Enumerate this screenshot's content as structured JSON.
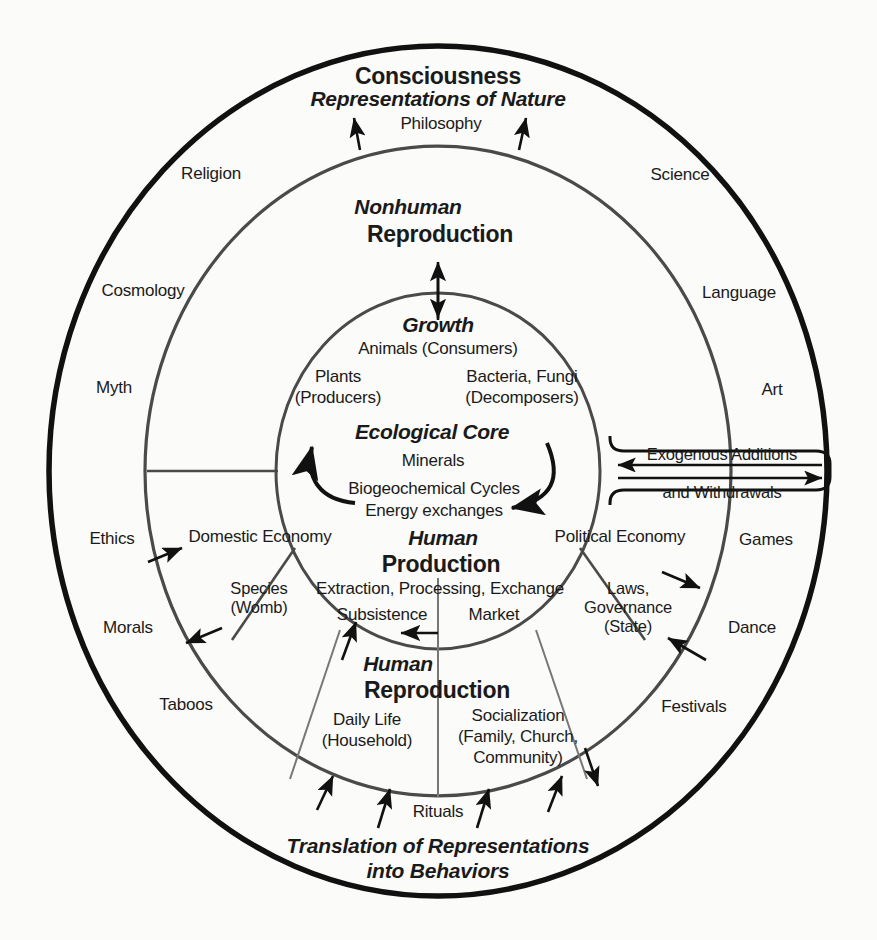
{
  "diagram": {
    "rings": {
      "outer": {
        "heading_bold": "Consciousness",
        "heading_italic": "Representations of Nature",
        "top_label": "Philosophy",
        "caption_line1": "Translation of Representations",
        "caption_line2": "into Behaviors",
        "labels": [
          "Religion",
          "Science",
          "Cosmology",
          "Language",
          "Myth",
          "Art",
          "Ethics",
          "Games",
          "Morals",
          "Dance",
          "Taboos",
          "Festivals"
        ]
      },
      "middle_top": {
        "heading_italic": "Nonhuman",
        "heading_bold": "Reproduction"
      },
      "middle_bottom": {
        "heading_italic": "Human",
        "heading_bold": "Reproduction",
        "left_label_line1": "Daily Life",
        "left_label_line2": "(Household)",
        "right_label_line1": "Socialization",
        "right_label_line2": "(Family, Church,",
        "right_label_line3": "Community)",
        "bottom_label": "Rituals"
      },
      "inner_band": {
        "left_sector": "Domestic Economy",
        "right_sector": "Political Economy",
        "left_sub_line1": "Species",
        "left_sub_line2": "(Womb)",
        "right_sub_line1": "Laws,",
        "right_sub_line2": "Governance",
        "right_sub_line3": "(State)",
        "heading_italic": "Human",
        "heading_bold": "Production",
        "detail": "Extraction, Processing, Exchange",
        "left_mode": "Subsistence",
        "right_mode": "Market"
      },
      "core": {
        "growth_italic": "Growth",
        "animals": "Animals (Consumers)",
        "plants_line1": "Plants",
        "plants_line2": "(Producers)",
        "bacteria_line1": "Bacteria, Fungi",
        "bacteria_line2": "(Decomposers)",
        "core_italic": "Ecological Core",
        "minerals": "Minerals",
        "cycles": "Biogeochemical Cycles",
        "energy": "Energy exchanges"
      }
    },
    "exogenous_box": {
      "line1": "Exogenous Additions",
      "line2": "and Withdrawals"
    },
    "colors": {
      "outer_stroke": "#111111",
      "inner_stroke": "#4a4a4a",
      "text": "#1a1a1a",
      "background": "#fbfbf9"
    }
  }
}
